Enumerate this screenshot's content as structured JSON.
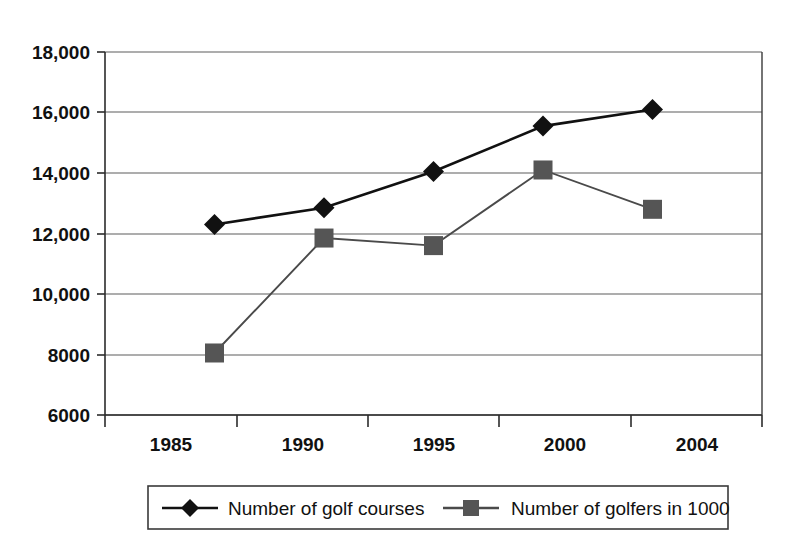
{
  "chart_data": {
    "type": "line",
    "title": "",
    "subtitle": "",
    "xlabel": "",
    "ylabel": "",
    "x": [
      1985,
      1990,
      1995,
      2000,
      2004
    ],
    "categories": [
      "1985",
      "1990",
      "1995",
      "2000",
      "2004"
    ],
    "xtick_labels": [
      "1985",
      "1990",
      "1995",
      "2000",
      "2004"
    ],
    "ytick_values": [
      6000,
      8000,
      10000,
      12000,
      14000,
      16000,
      18000
    ],
    "ytick_labels": [
      "6000",
      "8000",
      "10,000",
      "12,000",
      "14,000",
      "16,000",
      "18,000"
    ],
    "ylim": [
      6000,
      18000
    ],
    "grid": true,
    "legend_position": "bottom",
    "series": [
      {
        "name": "Number of golf courses",
        "marker": "diamond",
        "color": "#111111",
        "values": [
          12300,
          12850,
          14050,
          15550,
          16100
        ]
      },
      {
        "name": "Number of golfers in 1000",
        "marker": "square",
        "color": "#555555",
        "values": [
          8050,
          11850,
          11600,
          14100,
          12800
        ]
      }
    ]
  },
  "legend": {
    "entries": [
      {
        "label": "Number of golf courses",
        "marker": "diamond-marker-icon"
      },
      {
        "label": "Number of golfers in 1000",
        "marker": "square-marker-icon"
      }
    ]
  },
  "axes": {
    "y_labels": [
      "18,000",
      "16,000",
      "14,000",
      "12,000",
      "10,000",
      "8000",
      "6000"
    ],
    "x_labels": [
      "1985",
      "1990",
      "1995",
      "2000",
      "2004"
    ]
  },
  "colors": {
    "series_courses": "#111111",
    "series_golfers": "#555555",
    "grid": "#5c5c5c",
    "axis": "#2b2b2b",
    "background": "#ffffff"
  }
}
